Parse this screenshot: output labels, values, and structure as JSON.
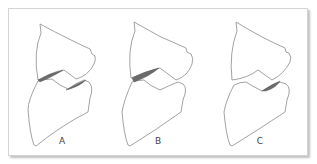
{
  "figure": {
    "colors": {
      "outline": "#8a8a8a",
      "contact_shading": "#6b6b6b",
      "frame_border": "#d4d4d4"
    },
    "panels": [
      {
        "label": "A",
        "contact_regions": [
          "left",
          "right"
        ]
      },
      {
        "label": "B",
        "contact_regions": [
          "left"
        ]
      },
      {
        "label": "C",
        "contact_regions": [
          "right"
        ]
      }
    ]
  }
}
